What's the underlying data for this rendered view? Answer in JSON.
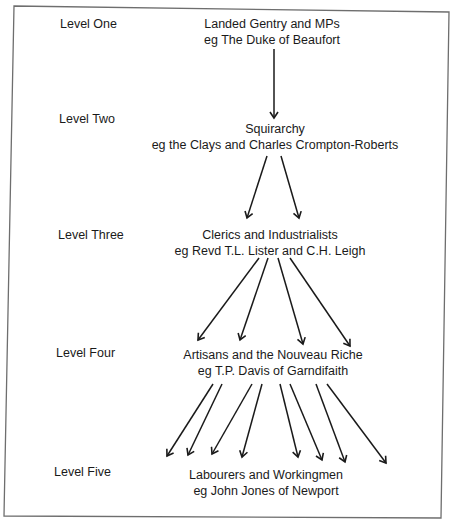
{
  "diagram": {
    "type": "hierarchy",
    "levels": [
      {
        "label": "Level One",
        "title": "Landed Gentry and MPs",
        "example": "eg The Duke of Beaufort"
      },
      {
        "label": "Level Two",
        "title": "Squirarchy",
        "example": "eg the Clays and Charles Crompton-Roberts"
      },
      {
        "label": "Level Three",
        "title": "Clerics and Industrialists",
        "example": "eg Revd T.L. Lister and C.H. Leigh"
      },
      {
        "label": "Level Four",
        "title": "Artisans and the Nouveau Riche",
        "example": "eg T.P. Davis of Garndifaith"
      },
      {
        "label": "Level Five",
        "title": "Labourers and Workingmen",
        "example": "eg John Jones of Newport"
      }
    ],
    "arrow_counts": {
      "one_to_two": 1,
      "two_to_three": 2,
      "three_to_four": 4,
      "four_to_five": 8
    },
    "colors": {
      "ink": "#1a1a1a",
      "border": "#6e6e6e",
      "background": "#ffffff"
    }
  }
}
